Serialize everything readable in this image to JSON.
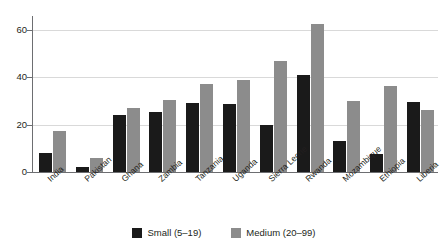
{
  "chart_data": {
    "type": "bar",
    "title": "",
    "subtitle": "",
    "xlabel": "",
    "ylabel": "",
    "ylim": [
      0,
      65
    ],
    "yticks": [
      0,
      20,
      40,
      60
    ],
    "grid": "horizontal",
    "legend_position": "bottom-center",
    "categories": [
      "India",
      "Pakistan",
      "Ghana",
      "Zambia",
      "Tanzania",
      "Uganda",
      "Sierra Leone",
      "Rwanda",
      "Mozambique",
      "Ethiopia",
      "Liberia"
    ],
    "series": [
      {
        "name": "Small (5–19)",
        "color": "#1a1a1a",
        "values": [
          8,
          2,
          24,
          25.5,
          29,
          28.5,
          20,
          41,
          13,
          7.5,
          29.5
        ]
      },
      {
        "name": "Medium (20–99)",
        "color": "#8c8c8c",
        "values": [
          17.5,
          6,
          27,
          30.5,
          37,
          39,
          47,
          62.5,
          30,
          36.5,
          26
        ]
      }
    ]
  },
  "axis": {
    "y_tick_labels": [
      "0",
      "20",
      "40",
      "60"
    ]
  },
  "legend": {
    "items": [
      {
        "label": "Small (5–19)",
        "color": "#1a1a1a"
      },
      {
        "label": "Medium (20–99)",
        "color": "#8c8c8c"
      }
    ]
  },
  "colors": {
    "small": "#1a1a1a",
    "medium": "#8c8c8c",
    "axis": "#6d6e71",
    "grid": "#d9d9d9",
    "text": "#231f20",
    "background": "#ffffff"
  }
}
